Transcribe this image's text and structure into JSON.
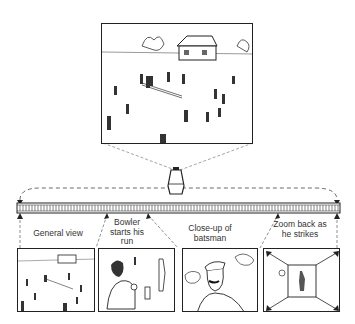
{
  "diagram": {
    "top_frame": {
      "description": "Wide establishing shot of cricket field with pavilion and players"
    },
    "camera_icon": "movie-camera-icon",
    "film_strip": {
      "frames": 4
    },
    "shots": [
      {
        "label": "General view",
        "description": "wide shot of cricket field"
      },
      {
        "label": "Bowler starts his run",
        "description": "bowler running up with ball"
      },
      {
        "label": "Close-up of batsman",
        "description": "close-up of batsman in cap"
      },
      {
        "label": "Zoom back as he strikes",
        "description": "zoom-out arrows around batsman striking"
      }
    ]
  }
}
